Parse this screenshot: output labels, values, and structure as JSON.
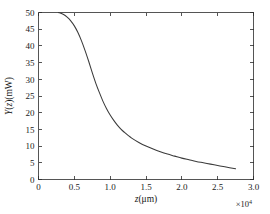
{
  "chart_data": {
    "type": "line",
    "title": "",
    "subtitle": "",
    "xlabel": "z(μm)",
    "ylabel": "Y(z)(mW)",
    "x_multiplier": "×10",
    "x_multiplier_exponent": "4",
    "xlim": [
      0,
      3.0
    ],
    "ylim": [
      0,
      50
    ],
    "grid": false,
    "legend": null,
    "xticks": [
      0,
      0.5,
      1.0,
      1.5,
      2.0,
      2.5,
      3.0
    ],
    "xtick_labels": [
      "0",
      "0.5",
      "1.0",
      "1.5",
      "2.0",
      "2.5",
      "3.0"
    ],
    "yticks": [
      0,
      5,
      10,
      15,
      20,
      25,
      30,
      35,
      40,
      45,
      50
    ],
    "ytick_labels": [
      "0",
      "5",
      "10",
      "15",
      "20",
      "25",
      "30",
      "35",
      "40",
      "45",
      "50"
    ],
    "series": [
      {
        "name": "Y(z)",
        "color": "#3a3a3a",
        "x": [
          0.28,
          0.35,
          0.4,
          0.45,
          0.5,
          0.55,
          0.6,
          0.65,
          0.7,
          0.75,
          0.8,
          0.85,
          0.9,
          0.95,
          1.0,
          1.05,
          1.1,
          1.15,
          1.2,
          1.25,
          1.3,
          1.4,
          1.5,
          1.6,
          1.7,
          1.8,
          1.9,
          2.0,
          2.1,
          2.2,
          2.3,
          2.4,
          2.5,
          2.6,
          2.75
        ],
        "y": [
          50.0,
          49.4,
          48.6,
          47.5,
          46.0,
          44.0,
          41.5,
          38.6,
          35.4,
          32.0,
          28.8,
          26.0,
          23.4,
          21.2,
          19.3,
          17.7,
          16.3,
          15.1,
          14.1,
          13.2,
          12.4,
          11.1,
          10.0,
          9.1,
          8.3,
          7.6,
          7.0,
          6.4,
          5.9,
          5.4,
          5.0,
          4.6,
          4.2,
          3.8,
          3.2
        ]
      }
    ]
  }
}
